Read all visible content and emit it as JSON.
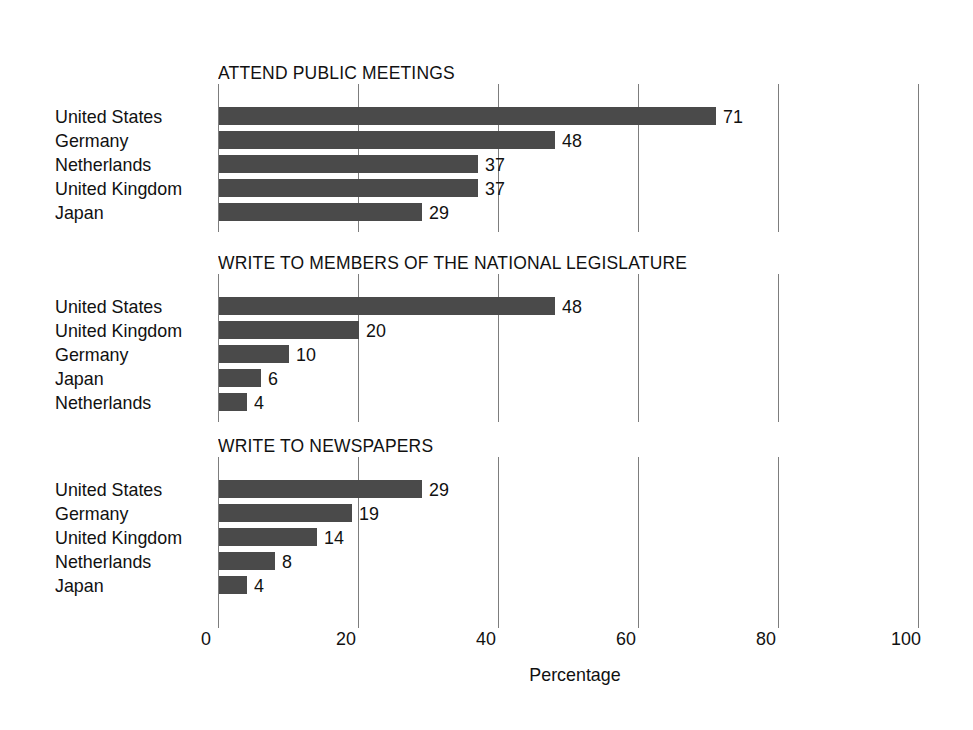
{
  "chart_data": {
    "type": "bar",
    "title": "",
    "orientation": "horizontal",
    "xlabel": "Percentage",
    "ylabel": "",
    "xlim": [
      0,
      100
    ],
    "xticks": [
      0,
      20,
      40,
      60,
      80,
      100
    ],
    "xtick_labels": [
      "0",
      "20",
      "40",
      "60",
      "80",
      "100"
    ],
    "grid": "vertical",
    "legend": "none",
    "value_labels": true,
    "bar_color": "#4a4a4a",
    "panels": [
      {
        "title": "ATTEND PUBLIC MEETINGS",
        "categories": [
          "United States",
          "Germany",
          "Netherlands",
          "United Kingdom",
          "Japan"
        ],
        "values": [
          71,
          48,
          37,
          37,
          29
        ]
      },
      {
        "title": "WRITE TO MEMBERS OF THE NATIONAL LEGISLATURE",
        "categories": [
          "United States",
          "United Kingdom",
          "Germany",
          "Japan",
          "Netherlands"
        ],
        "values": [
          48,
          20,
          10,
          6,
          4
        ]
      },
      {
        "title": "WRITE TO NEWSPAPERS",
        "categories": [
          "United States",
          "Germany",
          "United Kingdom",
          "Netherlands",
          "Japan"
        ],
        "values": [
          29,
          19,
          14,
          8,
          4
        ]
      }
    ]
  }
}
